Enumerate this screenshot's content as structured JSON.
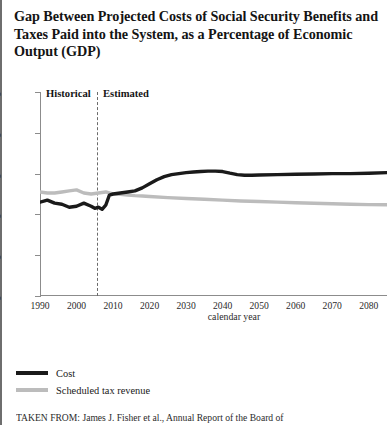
{
  "title": "Gap Between Projected Costs of Social Security Benefits and Taxes Paid into the System, as a Percentage of Economic Output (GDP)",
  "axis": {
    "x_title": "calendar year",
    "y_ticks": [
      "0%",
      "2%",
      "4%",
      "6%",
      "8%",
      "10%"
    ],
    "x_ticks": [
      "1990",
      "2000",
      "2010",
      "2020",
      "2030",
      "2040",
      "2050",
      "2060",
      "2070",
      "2080"
    ]
  },
  "annotations": {
    "historical": "Historical",
    "estimated": "Estimated"
  },
  "legend": [
    {
      "label": "Cost",
      "color": "#1a1a1a"
    },
    {
      "label": "Scheduled tax revenue",
      "color": "#bcbcbc"
    }
  ],
  "caption": "TAKEN FROM: James J. Fisher et al., Annual Report of the Board of",
  "chart_data": {
    "type": "line",
    "title": "Gap Between Projected Costs of Social Security Benefits and Taxes Paid into the System, as a Percentage of Economic Output (GDP)",
    "xlabel": "calendar year",
    "ylabel": "",
    "xlim": [
      1990,
      2085
    ],
    "ylim": [
      0,
      10
    ],
    "y_unit": "percent of GDP",
    "grid": false,
    "legend_position": "below-left",
    "divider_year": 2008,
    "divider_style": "dashed",
    "regions": [
      {
        "label": "Historical",
        "from": 1990,
        "to": 2008
      },
      {
        "label": "Estimated",
        "from": 2008,
        "to": 2085
      }
    ],
    "series": [
      {
        "name": "Cost",
        "color": "#1a1a1a",
        "x": [
          1990,
          1992,
          1994,
          1996,
          1998,
          2000,
          2002,
          2004,
          2005,
          2006,
          2007,
          2008,
          2009,
          2010,
          2012,
          2014,
          2016,
          2018,
          2020,
          2022,
          2024,
          2026,
          2028,
          2030,
          2032,
          2034,
          2036,
          2038,
          2040,
          2042,
          2044,
          2046,
          2048,
          2050,
          2055,
          2060,
          2065,
          2070,
          2075,
          2080,
          2085
        ],
        "values": [
          4.6,
          4.7,
          4.55,
          4.5,
          4.35,
          4.4,
          4.55,
          4.4,
          4.3,
          4.35,
          4.25,
          4.45,
          4.95,
          5.0,
          5.05,
          5.1,
          5.15,
          5.3,
          5.5,
          5.7,
          5.85,
          5.95,
          6.0,
          6.05,
          6.08,
          6.1,
          6.12,
          6.12,
          6.1,
          6.02,
          5.95,
          5.92,
          5.92,
          5.93,
          5.95,
          5.97,
          5.98,
          6.0,
          6.0,
          6.02,
          6.05
        ]
      },
      {
        "name": "Scheduled tax revenue",
        "color": "#bcbcbc",
        "x": [
          1990,
          1992,
          1994,
          1996,
          1998,
          2000,
          2002,
          2004,
          2006,
          2008,
          2010,
          2012,
          2014,
          2016,
          2018,
          2020,
          2025,
          2030,
          2035,
          2040,
          2045,
          2050,
          2055,
          2060,
          2065,
          2070,
          2075,
          2080,
          2085
        ],
        "values": [
          5.1,
          5.05,
          5.05,
          5.1,
          5.15,
          5.2,
          5.05,
          5.0,
          5.05,
          5.1,
          5.0,
          4.98,
          4.95,
          4.92,
          4.9,
          4.88,
          4.82,
          4.78,
          4.74,
          4.7,
          4.66,
          4.63,
          4.6,
          4.57,
          4.55,
          4.52,
          4.5,
          4.48,
          4.47
        ]
      }
    ]
  }
}
